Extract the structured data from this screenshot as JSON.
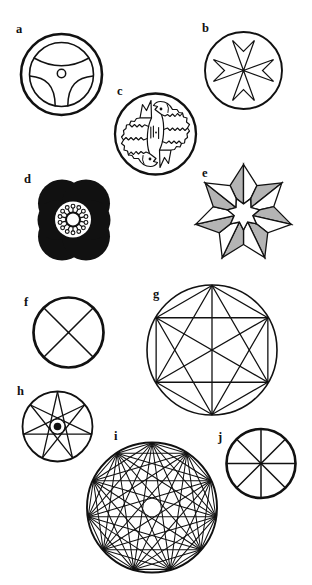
{
  "colors": {
    "ink": "#111111",
    "paper": "#ffffff",
    "shade": "#b4b4b4"
  },
  "figures": [
    {
      "label": "a",
      "icon": "steering-wheel-icon",
      "spokes": 3
    },
    {
      "label": "b",
      "icon": "maltese-cross-icon",
      "arms": 4
    },
    {
      "label": "c",
      "icon": "two-fish-icon",
      "fish": 2
    },
    {
      "label": "d",
      "icon": "black-flower-icon",
      "stamens": 14
    },
    {
      "label": "e",
      "icon": "seven-pointed-star-icon",
      "points": 7
    },
    {
      "label": "f",
      "icon": "circle-x-cross-icon",
      "spokes": 4
    },
    {
      "label": "g",
      "icon": "hexagon-complete-graph-icon",
      "vertices": 6
    },
    {
      "label": "h",
      "icon": "heptagram-icon",
      "points": 7,
      "step": 3
    },
    {
      "label": "i",
      "icon": "hendecagon-complete-graph-icon",
      "vertices": 11
    },
    {
      "label": "j",
      "icon": "eight-spoke-wheel-icon",
      "spokes": 8
    }
  ]
}
